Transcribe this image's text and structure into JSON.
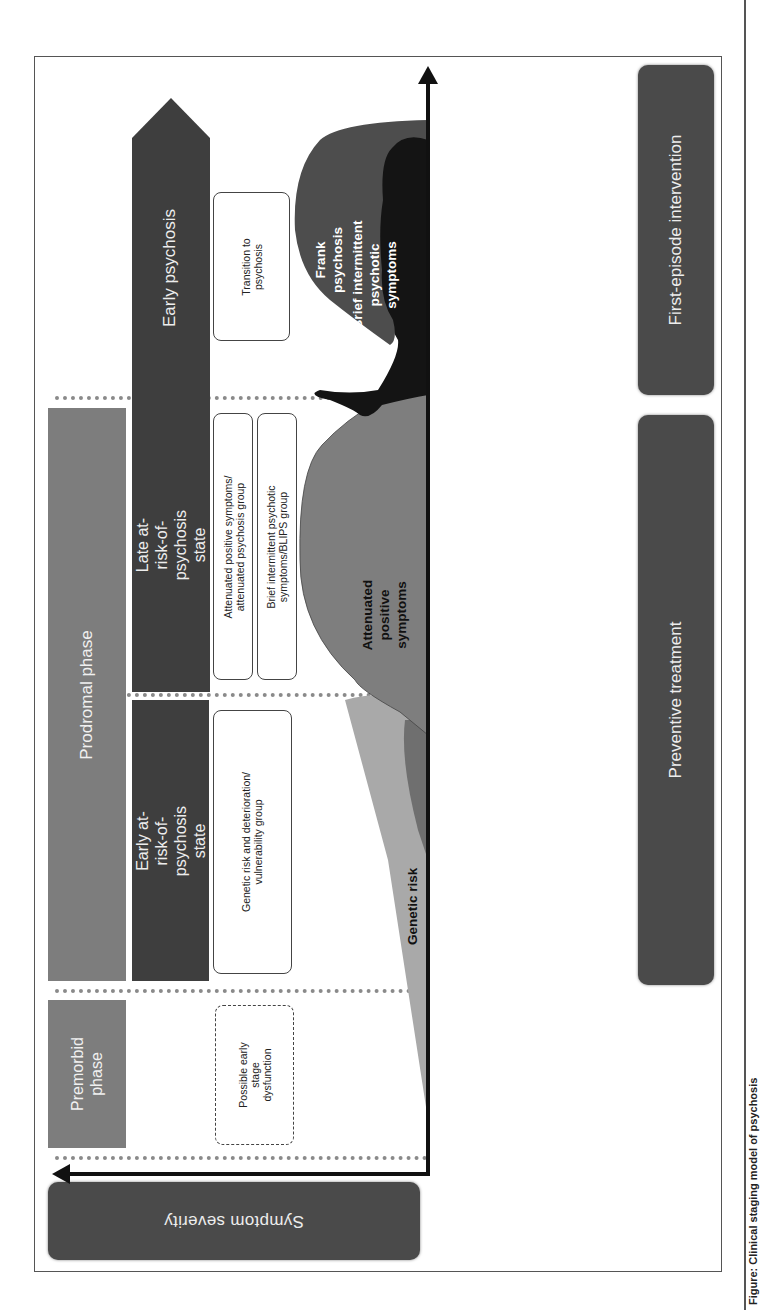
{
  "axes": {
    "y_label": "Symptom severity",
    "x_direction": "time (left-to-right in original orientation)"
  },
  "phases": [
    {
      "id": "premorbid",
      "label": "Premorbid phase"
    },
    {
      "id": "prodromal",
      "label": "Prodromal phase"
    }
  ],
  "states": [
    {
      "id": "early_at_risk",
      "label": "Early at-risk-of-psychosis state"
    },
    {
      "id": "late_at_risk",
      "label": "Late at-risk-of-psychosis state"
    },
    {
      "id": "early_psychosis",
      "label": "Early psychosis"
    }
  ],
  "groups": [
    {
      "id": "possible_dysfunction",
      "label": "Possible early stage dysfunction",
      "lines": [
        "Possible early",
        "stage",
        "dysfunction"
      ],
      "style": "dashed"
    },
    {
      "id": "genetic_group",
      "label": "Genetic risk and deterioration/ vulnerability group",
      "lines": [
        "Genetic risk and deterioration/",
        "vulnerability group"
      ]
    },
    {
      "id": "attenuated_group",
      "label": "Attenuated positive symptoms/ attenuated psychosis group",
      "lines": [
        "Attenuated positive symptoms/",
        "attenuated psychosis group"
      ]
    },
    {
      "id": "blips_group",
      "label": "Brief intermittent psychotic symptoms/BLIPS group",
      "lines": [
        "Brief intermittent psychotic",
        "symptoms/BLIPS group"
      ]
    },
    {
      "id": "transition",
      "label": "Transition to psychosis",
      "lines": [
        "Transition to",
        "psychosis"
      ]
    }
  ],
  "curves": [
    {
      "id": "genetic_risk",
      "label": "Genetic risk",
      "color": "#a9a9a9"
    },
    {
      "id": "attenuated",
      "label": "Attenuated positive symptoms",
      "lines": [
        "Attenuated",
        "positive",
        "symptoms"
      ],
      "color": "#7e7e7e"
    },
    {
      "id": "blips",
      "label": "Brief intermittent psychotic symptoms",
      "lines": [
        "Brief intermittent",
        "psychotic",
        "symptoms"
      ],
      "color": "#141414"
    },
    {
      "id": "frank",
      "label": "Frank psychosis",
      "lines": [
        "Frank",
        "psychosis"
      ],
      "color": "#4d4d4d"
    }
  ],
  "treatments": [
    {
      "id": "preventive",
      "label": "Preventive treatment"
    },
    {
      "id": "first_episode",
      "label": "First-episode intervention"
    }
  ],
  "caption": {
    "text": "Figure: Clinical staging model of psychosis"
  },
  "colors": {
    "phase_box": "#7d7d7d",
    "state_box": "#3e3e3e",
    "treatment_box": "#4a4a4a",
    "divider": "#8a8a8a"
  }
}
